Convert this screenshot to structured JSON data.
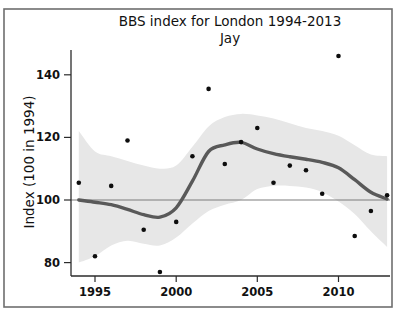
{
  "figure": {
    "width_px": 400,
    "height_px": 314
  },
  "chart_data": {
    "type": "line",
    "title": "BBS index for London 1994-2013",
    "subtitle": "Jay",
    "xlabel": "",
    "ylabel": "Index (100 in 1994)",
    "x": [
      1994,
      1995,
      1996,
      1997,
      1998,
      1999,
      2000,
      2001,
      2002,
      2003,
      2004,
      2005,
      2006,
      2007,
      2008,
      2009,
      2010,
      2011,
      2012,
      2013
    ],
    "series": [
      {
        "name": "annual index points",
        "type": "scatter",
        "values": [
          105.5,
          82,
          104.5,
          119,
          90.5,
          77,
          93,
          114,
          135.5,
          111.5,
          118.5,
          123,
          105.5,
          111,
          109.5,
          102,
          146,
          88.5,
          96.5,
          101.5
        ]
      },
      {
        "name": "smoothed trend",
        "type": "line",
        "values": [
          100,
          99.3,
          98.5,
          97,
          95.3,
          94.5,
          97.5,
          106,
          115.5,
          117.6,
          118.4,
          116.3,
          114.8,
          113.8,
          113,
          112,
          110.3,
          106.5,
          102.5,
          100.3
        ]
      },
      {
        "name": "confidence band upper",
        "type": "band-upper",
        "values": [
          122,
          115.5,
          114,
          112.5,
          111,
          110,
          111,
          117,
          123.5,
          126.5,
          127.5,
          127,
          126,
          124.5,
          123,
          122,
          120.5,
          117.5,
          114.5,
          114
        ]
      },
      {
        "name": "confidence band lower",
        "type": "band-lower",
        "values": [
          80,
          82,
          85.5,
          87,
          86,
          85.5,
          88,
          92.5,
          96.5,
          98.5,
          100,
          103.5,
          104.5,
          104.5,
          104,
          102.5,
          99.5,
          95.5,
          90,
          85
        ]
      }
    ],
    "reference_line_y": 100,
    "x_ticks": [
      1995,
      2000,
      2005,
      2010
    ],
    "y_ticks": [
      80,
      100,
      120,
      140
    ],
    "xlim": [
      1993.5,
      2013.2
    ],
    "ylim": [
      76,
      148.5
    ],
    "grid": false,
    "legend": "none",
    "colors": {
      "band_fill": "#e7e7e7",
      "trend_line": "#595959",
      "reference_line": "#7d7d7d",
      "points": "#0d0d0d",
      "axis": "#2b2b2b",
      "outer_border": "#6e6e6e",
      "background": "#ffffff"
    }
  }
}
